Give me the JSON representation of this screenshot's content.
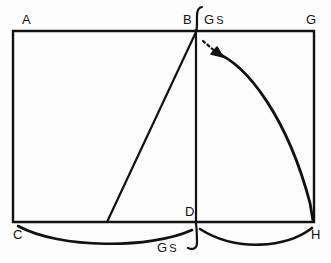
{
  "figure": {
    "background_color": "#fdfdfd",
    "stroke_color": "#111111",
    "vertices": [
      {
        "id": "A",
        "label": "A",
        "x": 13,
        "y": 31
      },
      {
        "id": "B",
        "label": "B",
        "x": 196,
        "y": 31
      },
      {
        "id": "G",
        "label": "G",
        "x": 314,
        "y": 31
      },
      {
        "id": "C",
        "label": "C",
        "x": 13,
        "y": 222
      },
      {
        "id": "D",
        "label": "D",
        "x": 196,
        "y": 222
      },
      {
        "id": "H",
        "label": "H",
        "x": 314,
        "y": 222
      }
    ],
    "annotations": {
      "gs_top": {
        "g": "G",
        "s": "S",
        "text": "G S"
      },
      "gs_bottom": {
        "g": "G",
        "s": "S",
        "text": "G S"
      }
    },
    "elements": {
      "rectangle": "A-G-H-C",
      "vertical_line": "B-D",
      "diagonal_line": "B to point on CD",
      "swing_arc": "B to H",
      "arc_left": "C to D",
      "arc_right": "D to H",
      "arrow": "dashed arrow indicating swing direction",
      "brace_top": "curly hook at B",
      "brace_bottom": "curly hook at D"
    }
  }
}
